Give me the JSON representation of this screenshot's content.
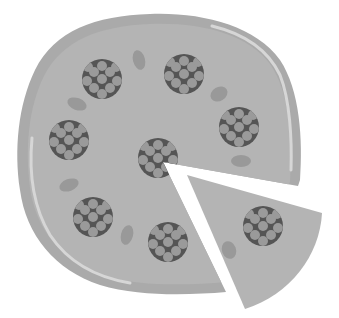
{
  "illustration": {
    "subject": "pizza with one slice cut out",
    "style": "grayscale flat clipart",
    "colors": {
      "background": "#ffffff",
      "crust": "#aaaaaa",
      "crust_highlight": "#d6d6d6",
      "cheese": "#b4b4b4",
      "pepperoni": "#555555",
      "pepperoni_dots": "#9a9a9a",
      "olive": "#999999"
    },
    "pepperoni": [
      {
        "x": 102,
        "y": 79
      },
      {
        "x": 184,
        "y": 74
      },
      {
        "x": 239,
        "y": 127
      },
      {
        "x": 69,
        "y": 140
      },
      {
        "x": 158,
        "y": 158
      },
      {
        "x": 93,
        "y": 217
      },
      {
        "x": 168,
        "y": 242
      },
      {
        "x": 263,
        "y": 226
      }
    ],
    "olives": [
      {
        "x": 139,
        "y": 60,
        "rx": 6,
        "ry": 10,
        "rot": -15
      },
      {
        "x": 77,
        "y": 104,
        "rx": 10,
        "ry": 6,
        "rot": 20
      },
      {
        "x": 219,
        "y": 94,
        "rx": 9,
        "ry": 7,
        "rot": -30
      },
      {
        "x": 69,
        "y": 185,
        "rx": 10,
        "ry": 6,
        "rot": -20
      },
      {
        "x": 127,
        "y": 235,
        "rx": 6,
        "ry": 10,
        "rot": 15
      },
      {
        "x": 241,
        "y": 161,
        "rx": 10,
        "ry": 6,
        "rot": 0
      },
      {
        "x": 229,
        "y": 250,
        "rx": 7,
        "ry": 9,
        "rot": -20
      }
    ]
  }
}
